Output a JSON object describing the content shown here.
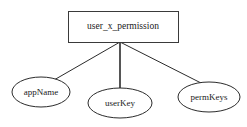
{
  "diagram": {
    "type": "entity-relationship-diagram",
    "background_color": "#ffffff",
    "stroke_color": "#2b2b2b",
    "text_color": "#1a1a1a",
    "entity": {
      "label": "user_x_permission",
      "shape": "rectangle",
      "x": 68,
      "y": 11,
      "width": 110,
      "height": 31,
      "center_x": 123,
      "center_y": 26.5
    },
    "attributes": [
      {
        "label": "appName",
        "shape": "ellipse",
        "center_x": 41,
        "center_y": 92,
        "rx": 29,
        "ry": 15
      },
      {
        "label": "userKey",
        "shape": "ellipse",
        "center_x": 120,
        "center_y": 103,
        "rx": 32,
        "ry": 15
      },
      {
        "label": "permKeys",
        "shape": "ellipse",
        "center_x": 209,
        "center_y": 97,
        "rx": 31,
        "ry": 15
      }
    ],
    "connectors": [
      {
        "name": "entity-to-appName",
        "from_x": 120,
        "from_y": 42,
        "to_x": 54,
        "to_y": 80
      },
      {
        "name": "entity-to-userKey",
        "from_x": 120,
        "from_y": 42,
        "to_x": 120,
        "to_y": 88
      },
      {
        "name": "entity-to-permKeys",
        "from_x": 120,
        "from_y": 42,
        "to_x": 203,
        "to_y": 84
      }
    ]
  }
}
